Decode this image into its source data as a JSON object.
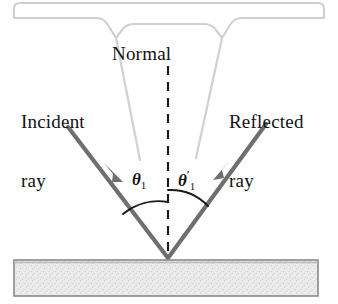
{
  "figure": {
    "labels": {
      "normal": "Normal",
      "incident_line1": "Incident",
      "incident_line2": "ray",
      "reflected_line1": "Reflected",
      "reflected_line2": "ray"
    },
    "angles": {
      "incidence_symbol": "θ",
      "incidence_subscript": "1",
      "reflection_symbol": "θ",
      "reflection_subscript": "1",
      "reflection_prime": "′",
      "incidence_degrees": 45,
      "reflection_degrees": 45
    },
    "colors": {
      "ray": "#6f6f6f",
      "normal_dash": "#1a1a1a",
      "leader_line": "#d2d2d2",
      "bracket": "#cfcfcf",
      "surface_fill": "#e9e9e9",
      "surface_border": "#8a8a8a",
      "text": "#121212"
    },
    "geometry": {
      "vertex_x": 168,
      "vertex_y": 258,
      "incident_start_x": 68,
      "incident_start_y": 127,
      "reflected_end_x": 266,
      "reflected_end_y": 124,
      "normal_top_y": 66,
      "surface_top_y": 260,
      "surface_bottom_y": 296,
      "surface_left_x": 14,
      "surface_right_x": 318
    },
    "elements": {
      "bracket_name": "top-bracket",
      "surface_name": "mirror-surface",
      "incident_ray_name": "incident-ray",
      "reflected_ray_name": "reflected-ray",
      "normal_name": "normal-dashed-line"
    }
  }
}
